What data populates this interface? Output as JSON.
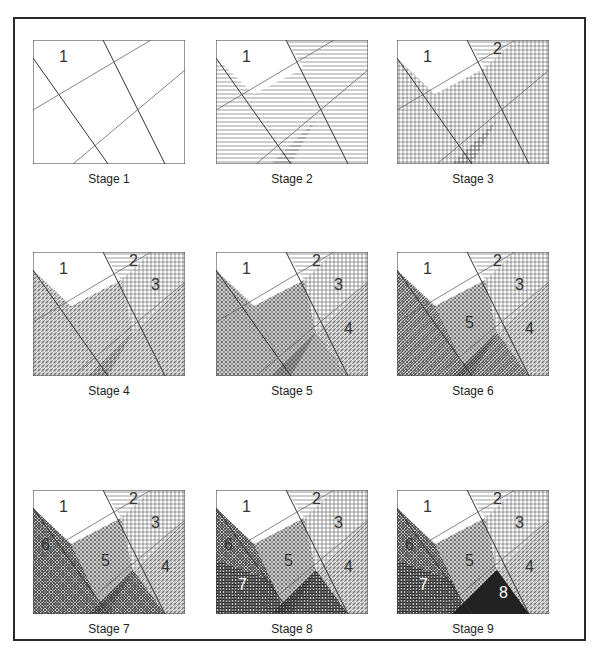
{
  "figure": {
    "stages": [
      {
        "caption": "Stage 1",
        "labels": [
          "1"
        ]
      },
      {
        "caption": "Stage 2",
        "labels": [
          "1"
        ]
      },
      {
        "caption": "Stage 3",
        "labels": [
          "1",
          "2"
        ]
      },
      {
        "caption": "Stage 4",
        "labels": [
          "1",
          "2",
          "3"
        ]
      },
      {
        "caption": "Stage 5",
        "labels": [
          "1",
          "2",
          "3",
          "4"
        ]
      },
      {
        "caption": "Stage 6",
        "labels": [
          "1",
          "2",
          "3",
          "4",
          "5"
        ]
      },
      {
        "caption": "Stage 7",
        "labels": [
          "1",
          "2",
          "3",
          "4",
          "5",
          "6"
        ]
      },
      {
        "caption": "Stage 8",
        "labels": [
          "1",
          "2",
          "3",
          "4",
          "5",
          "6",
          "7"
        ]
      },
      {
        "caption": "Stage 9",
        "labels": [
          "1",
          "2",
          "3",
          "4",
          "5",
          "6",
          "7",
          "8"
        ]
      }
    ]
  },
  "colors": {
    "ink": "#2a2a2a",
    "paper": "#ffffff",
    "hatch": "#555555"
  }
}
